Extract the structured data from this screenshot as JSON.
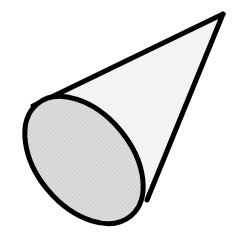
{
  "figure": {
    "shape": "cone",
    "colors": {
      "background": "#ffffff",
      "outline": "#000000",
      "lateral_surface": "#f2f2f2",
      "base_face": "#d6d6d6"
    },
    "geometry": {
      "apex": [
        222,
        14
      ],
      "base_center": [
        84,
        160
      ],
      "base_rx": 48,
      "base_ry": 73,
      "base_rotation_deg": -40,
      "tangent_left": [
        36,
        104
      ],
      "tangent_right": [
        147,
        200
      ]
    }
  }
}
